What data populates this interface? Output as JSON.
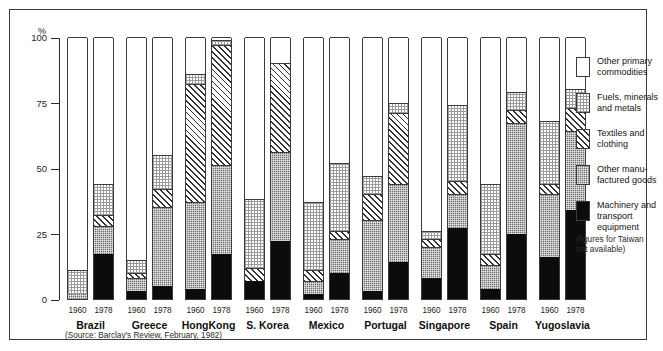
{
  "axis": {
    "unit_label": "%",
    "ticks": [
      "100",
      "75",
      "50",
      "25",
      "0"
    ],
    "tick_values": [
      100,
      75,
      50,
      25,
      0
    ]
  },
  "source_note": "(Source: Barclay's Review, February, 1982)",
  "taiwan_note": "(figures for Taiwan\nnot available)",
  "legend": {
    "items": [
      {
        "key": "other_primary",
        "label": "Other primary\ncommodities",
        "fill": "white"
      },
      {
        "key": "fuels_minerals",
        "label": "Fuels, minerals\nand  metals",
        "fill": "dots"
      },
      {
        "key": "textiles",
        "label": "Textiles and\nclothing",
        "fill": "hatch"
      },
      {
        "key": "other_manufactured",
        "label": "Other manu-\nfactured goods",
        "fill": "gray"
      },
      {
        "key": "machinery",
        "label": "Machinery and\ntransport\nequipment",
        "fill": "black"
      }
    ]
  },
  "chart_data": {
    "type": "bar",
    "variant": "stacked-100",
    "title": "",
    "xlabel": "",
    "ylabel": "%",
    "ylim": [
      0,
      100
    ],
    "grid": false,
    "legend_position": "right",
    "series": [
      {
        "name": "Machinery and transport equipment",
        "key": "machinery",
        "fill": "black"
      },
      {
        "name": "Other manufactured goods",
        "key": "other_manufactured",
        "fill": "gray"
      },
      {
        "name": "Textiles and clothing",
        "key": "textiles",
        "fill": "hatch"
      },
      {
        "name": "Fuels, minerals and metals",
        "key": "fuels_minerals",
        "fill": "dots"
      },
      {
        "name": "Other primary commodities",
        "key": "other_primary",
        "fill": "white"
      }
    ],
    "groups": [
      {
        "country": "Brazil",
        "bars": [
          {
            "year": "1960",
            "machinery": 0,
            "other_manufactured": 2,
            "textiles": 0,
            "fuels_minerals": 9,
            "other_primary": 89
          },
          {
            "year": "1978",
            "machinery": 17,
            "other_manufactured": 11,
            "textiles": 4,
            "fuels_minerals": 12,
            "other_primary": 56
          }
        ]
      },
      {
        "country": "Greece",
        "bars": [
          {
            "year": "1960",
            "machinery": 3,
            "other_manufactured": 5,
            "textiles": 2,
            "fuels_minerals": 5,
            "other_primary": 85
          },
          {
            "year": "1978",
            "machinery": 5,
            "other_manufactured": 30,
            "textiles": 7,
            "fuels_minerals": 13,
            "other_primary": 45
          }
        ]
      },
      {
        "country": "HongKong",
        "bars": [
          {
            "year": "1960",
            "machinery": 4,
            "other_manufactured": 33,
            "textiles": 45,
            "fuels_minerals": 4,
            "other_primary": 14
          },
          {
            "year": "1978",
            "machinery": 17,
            "other_manufactured": 34,
            "textiles": 46,
            "fuels_minerals": 2,
            "other_primary": 1
          }
        ]
      },
      {
        "country": "S. Korea",
        "bars": [
          {
            "year": "1960",
            "machinery": 7,
            "other_manufactured": 0,
            "textiles": 5,
            "fuels_minerals": 26,
            "other_primary": 62
          },
          {
            "year": "1978",
            "machinery": 22,
            "other_manufactured": 34,
            "textiles": 34,
            "fuels_minerals": 0,
            "other_primary": 10
          }
        ]
      },
      {
        "country": "Mexico",
        "bars": [
          {
            "year": "1960",
            "machinery": 2,
            "other_manufactured": 5,
            "textiles": 4,
            "fuels_minerals": 26,
            "other_primary": 63
          },
          {
            "year": "1978",
            "machinery": 10,
            "other_manufactured": 13,
            "textiles": 3,
            "fuels_minerals": 26,
            "other_primary": 48
          }
        ]
      },
      {
        "country": "Portugal",
        "bars": [
          {
            "year": "1960",
            "machinery": 3,
            "other_manufactured": 27,
            "textiles": 10,
            "fuels_minerals": 7,
            "other_primary": 53
          },
          {
            "year": "1978",
            "machinery": 14,
            "other_manufactured": 30,
            "textiles": 27,
            "fuels_minerals": 4,
            "other_primary": 25
          }
        ]
      },
      {
        "country": "Singapore",
        "bars": [
          {
            "year": "1960",
            "machinery": 8,
            "other_manufactured": 12,
            "textiles": 3,
            "fuels_minerals": 3,
            "other_primary": 74
          },
          {
            "year": "1978",
            "machinery": 27,
            "other_manufactured": 13,
            "textiles": 5,
            "fuels_minerals": 29,
            "other_primary": 26
          }
        ]
      },
      {
        "country": "Spain",
        "bars": [
          {
            "year": "1960",
            "machinery": 4,
            "other_manufactured": 9,
            "textiles": 4,
            "fuels_minerals": 27,
            "other_primary": 56
          },
          {
            "year": "1978",
            "machinery": 25,
            "other_manufactured": 42,
            "textiles": 5,
            "fuels_minerals": 7,
            "other_primary": 21
          }
        ]
      },
      {
        "country": "Yugoslavia",
        "bars": [
          {
            "year": "1960",
            "machinery": 16,
            "other_manufactured": 24,
            "textiles": 4,
            "fuels_minerals": 24,
            "other_primary": 32
          },
          {
            "year": "1978",
            "machinery": 34,
            "other_manufactured": 30,
            "textiles": 9,
            "fuels_minerals": 7,
            "other_primary": 20
          }
        ]
      }
    ]
  }
}
